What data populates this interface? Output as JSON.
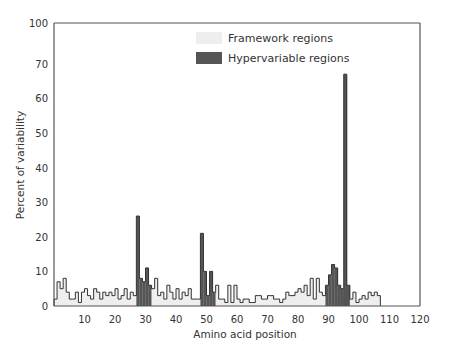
{
  "chart_data": {
    "type": "bar",
    "title": "",
    "xlabel": "Amino acid position",
    "ylabel": "Percent of variability",
    "xlim": [
      0,
      120
    ],
    "ylim": [
      0,
      100
    ],
    "y_axis_break": {
      "between": [
        70,
        100
      ],
      "note": "100 tick placed directly above 70 (broken axis)"
    },
    "xticks": [
      10,
      20,
      30,
      40,
      50,
      60,
      70,
      80,
      90,
      100,
      110,
      120
    ],
    "yticks": [
      0,
      10,
      20,
      30,
      40,
      50,
      60,
      70,
      100
    ],
    "grid": false,
    "legend": {
      "position": "top-center",
      "entries": [
        {
          "label": "Framework regions",
          "color": "#eeeeee"
        },
        {
          "label": "Hypervariable regions",
          "color": "#555555"
        }
      ]
    },
    "hypervariable_ranges": [
      [
        28,
        32
      ],
      [
        49,
        53
      ],
      [
        90,
        97
      ]
    ],
    "x": [
      1,
      2,
      3,
      4,
      5,
      6,
      7,
      8,
      9,
      10,
      11,
      12,
      13,
      14,
      15,
      16,
      17,
      18,
      19,
      20,
      21,
      22,
      23,
      24,
      25,
      26,
      27,
      28,
      29,
      30,
      31,
      32,
      33,
      34,
      35,
      36,
      37,
      38,
      39,
      40,
      41,
      42,
      43,
      44,
      45,
      46,
      47,
      48,
      49,
      50,
      51,
      52,
      53,
      54,
      55,
      56,
      57,
      58,
      59,
      60,
      61,
      62,
      63,
      64,
      65,
      66,
      67,
      68,
      69,
      70,
      71,
      72,
      73,
      74,
      75,
      76,
      77,
      78,
      79,
      80,
      81,
      82,
      83,
      84,
      85,
      86,
      87,
      88,
      89,
      90,
      91,
      92,
      93,
      94,
      95,
      96,
      97,
      98,
      99,
      100,
      101,
      102,
      103,
      104,
      105,
      106,
      107
    ],
    "values": [
      2,
      7,
      5,
      8,
      4,
      2,
      2,
      4,
      1,
      4,
      5,
      3,
      2,
      5,
      4,
      2,
      4,
      3,
      4,
      3,
      5,
      2,
      3,
      5,
      2,
      4,
      3,
      26,
      8,
      7,
      11,
      6,
      5,
      8,
      3,
      4,
      2,
      6,
      4,
      2,
      5,
      2,
      4,
      3,
      5,
      2,
      2,
      2,
      21,
      10,
      3,
      10,
      4,
      6,
      2,
      2,
      1,
      6,
      1,
      6,
      2,
      1,
      2,
      2,
      1,
      1,
      3,
      3,
      2,
      2,
      3,
      3,
      2,
      2,
      1,
      2,
      4,
      3,
      3,
      4,
      5,
      4,
      6,
      3,
      8,
      2,
      8,
      4,
      3,
      6,
      9,
      12,
      11,
      6,
      5,
      67,
      6,
      2,
      4,
      1,
      2,
      3,
      2,
      4,
      3,
      4,
      3
    ]
  },
  "labels": {
    "xlabel": "Amino acid position",
    "ylabel": "Percent of variability",
    "legend_framework": "Framework regions",
    "legend_hypervariable": "Hypervariable regions"
  },
  "colors": {
    "framework_fill": "#eeeeee",
    "hypervariable_fill": "#555555",
    "outline": "#333333",
    "axis": "#555555"
  }
}
